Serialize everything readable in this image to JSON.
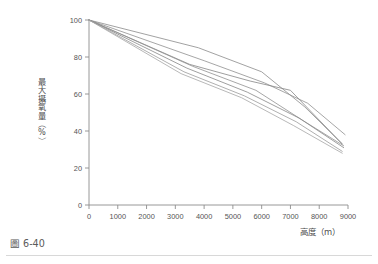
{
  "figure": {
    "caption": "圖 6-40",
    "background_color": "#ffffff",
    "axis_color": "#8d8d8d",
    "text_color": "#4c4c4c"
  },
  "chart_data": {
    "type": "line",
    "title": "",
    "subtitle": "",
    "xlabel": "高度（m）",
    "ylabel": "最大攝氧量（%）",
    "xlim": [
      0,
      9000
    ],
    "ylim": [
      0,
      100
    ],
    "xticks": [
      0,
      1000,
      2000,
      3000,
      4000,
      5000,
      6000,
      7000,
      8000,
      9000
    ],
    "yticks": [
      0,
      20,
      40,
      60,
      80,
      100
    ],
    "xtick_labels": [
      "0",
      "1000",
      "2000",
      "3000",
      "4000",
      "5000",
      "6000",
      "7000",
      "8000",
      "9000"
    ],
    "ytick_labels": [
      "0",
      "20",
      "40",
      "60",
      "80",
      "100"
    ],
    "grid": false,
    "legend": "none",
    "annotations": [],
    "series": [
      {
        "name": "study-1",
        "color": "#8a8a8a",
        "width": 0.8,
        "x": [
          0,
          3800,
          6000,
          7500,
          8800
        ],
        "values": [
          100,
          85,
          72,
          53,
          33
        ]
      },
      {
        "name": "study-2",
        "color": "#8f8f8f",
        "width": 0.8,
        "x": [
          0,
          4000,
          6100,
          7600,
          8900
        ],
        "values": [
          100,
          78,
          66,
          55,
          38
        ]
      },
      {
        "name": "study-3",
        "color": "#858585",
        "width": 0.8,
        "x": [
          0,
          3500,
          5600,
          7000,
          8800
        ],
        "values": [
          100,
          76,
          67,
          62,
          33
        ]
      },
      {
        "name": "study-4",
        "color": "#909090",
        "width": 0.8,
        "x": [
          0,
          3600,
          5800,
          7400,
          8850
        ],
        "values": [
          100,
          75,
          62,
          46,
          32
        ]
      },
      {
        "name": "study-5",
        "color": "#878787",
        "width": 0.8,
        "x": [
          0,
          3400,
          5500,
          7300,
          8850
        ],
        "values": [
          100,
          74,
          61,
          47,
          31
        ]
      },
      {
        "name": "study-6",
        "color": "#9a9a9a",
        "width": 0.8,
        "x": [
          0,
          3300,
          5400,
          7200,
          8800
        ],
        "values": [
          100,
          72,
          59,
          45,
          29
        ]
      },
      {
        "name": "study-7",
        "color": "#a6a6a6",
        "width": 0.8,
        "x": [
          0,
          3200,
          5300,
          7100,
          8800
        ],
        "values": [
          100,
          71,
          58,
          43,
          28
        ]
      }
    ]
  }
}
